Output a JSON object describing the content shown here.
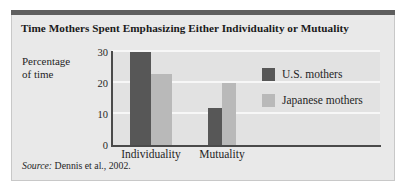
{
  "figure": {
    "title": "Time Mothers Spent Emphasizing Either Individuality or Mutuality",
    "source_keyword": "Source:",
    "source_text": " Dennis et al., 2002.",
    "frame_color": "#e9e9e9",
    "header_rule_color": "#5e5e5e"
  },
  "chart_data": {
    "type": "bar",
    "title": "Time Mothers Spent Emphasizing Either Individuality or Mutuality",
    "categories": [
      "Individuality",
      "Mutuality"
    ],
    "series": [
      {
        "name": "U.S. mothers",
        "values": [
          30,
          12
        ],
        "color": "#575757"
      },
      {
        "name": "Japanese mothers",
        "values": [
          23,
          20
        ],
        "color": "#b9b9b9"
      }
    ],
    "xlabel": "",
    "ylabel": "Percentage of time",
    "ylim": [
      0,
      30
    ],
    "yticks": [
      0,
      10,
      20,
      30
    ],
    "ytick_labels": [
      "0",
      "10",
      "20",
      "30"
    ],
    "grid": true,
    "grid_color": "#f7f7f7",
    "legend_position": "right-inside",
    "plot_background": "#e2e2e2"
  },
  "axis": {
    "y_title_line1": "Percentage",
    "y_title_line2": "of time"
  }
}
